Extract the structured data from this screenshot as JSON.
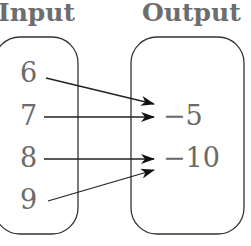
{
  "diagram": {
    "type": "mapping-diagram",
    "input_title": "Input",
    "output_title": "Output",
    "inputs": [
      "6",
      "7",
      "8",
      "9"
    ],
    "outputs": [
      "−5",
      "−10"
    ],
    "mappings": [
      {
        "from": "6",
        "to": "−5"
      },
      {
        "from": "7",
        "to": "−5"
      },
      {
        "from": "8",
        "to": "−10"
      },
      {
        "from": "9",
        "to": "−10"
      }
    ],
    "colors": {
      "text": "#6a6a6a",
      "stroke": "#222222",
      "background": "#ffffff"
    }
  }
}
